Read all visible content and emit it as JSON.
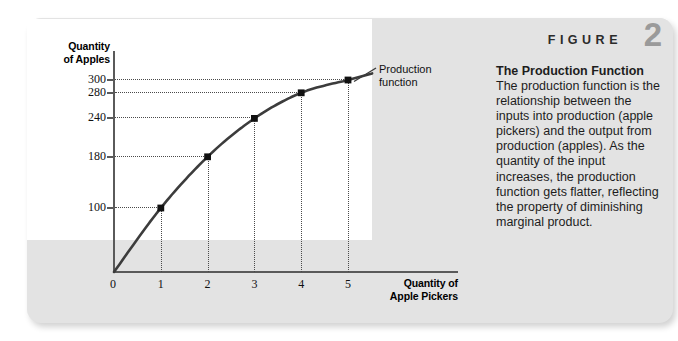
{
  "figure": {
    "label_word": "FIGURE",
    "number": "2",
    "caption_title": "The Production Function",
    "caption_body": "The production function is the relationship between the inputs into production (apple pickers) and the output from production (apples). As the quantity of the input increases, the production function gets flatter, reflecting the property of diminishing marginal product."
  },
  "chart": {
    "y_axis_title_line1": "Quantity",
    "y_axis_title_line2": "of Apples",
    "x_axis_title_line1": "Quantity of",
    "x_axis_title_line2": "Apple Pickers",
    "series_label_line1": "Production",
    "series_label_line2": "function",
    "origin_label": "0",
    "curve_color": "#3c3c3c",
    "axis_color": "#5a5a5a",
    "panel_color": "#e3e3e3",
    "plot_color": "#ffffff"
  },
  "chart_data": {
    "type": "line",
    "title": "The Production Function",
    "xlabel": "Quantity of Apple Pickers",
    "ylabel": "Quantity of Apples",
    "x": [
      0,
      1,
      2,
      3,
      4,
      5
    ],
    "values": [
      0,
      100,
      180,
      240,
      280,
      300
    ],
    "series": [
      {
        "name": "Production function",
        "x": [
          0,
          1,
          2,
          3,
          4,
          5
        ],
        "values": [
          0,
          100,
          180,
          240,
          280,
          300
        ]
      }
    ],
    "x_ticks": [
      "0",
      "1",
      "2",
      "3",
      "4",
      "5"
    ],
    "y_ticks": [
      "100",
      "180",
      "240",
      "280",
      "300"
    ],
    "y_tick_values": [
      100,
      180,
      240,
      280,
      300
    ],
    "xlim": [
      0,
      5.7
    ],
    "ylim": [
      0,
      330
    ],
    "grid": "dotted-guide-lines-to-each-point",
    "legend": "inline-annotation-right",
    "markers": "filled-black-squares",
    "point_labels": [
      "0",
      "100",
      "180",
      "240",
      "280",
      "300"
    ]
  }
}
